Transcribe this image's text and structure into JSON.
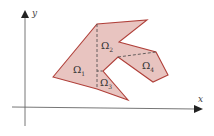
{
  "diagram": {
    "axes": {
      "x_label": "x",
      "y_label": "y",
      "color": "#555555"
    },
    "region": {
      "fill": "#e8c4c0",
      "stroke": "#b0403a",
      "outline": [
        [
          53,
          77
        ],
        [
          97,
          24
        ],
        [
          147,
          20
        ],
        [
          119,
          42
        ],
        [
          156,
          52
        ],
        [
          168,
          75
        ],
        [
          153,
          82
        ],
        [
          118,
          57
        ],
        [
          103,
          71
        ],
        [
          128,
          100
        ],
        [
          97,
          89
        ]
      ]
    },
    "subregions": [
      {
        "name": "Omega 1",
        "symbol": "Ω",
        "index": "1"
      },
      {
        "name": "Omega 2",
        "symbol": "Ω",
        "index": "2"
      },
      {
        "name": "Omega 3",
        "symbol": "Ω",
        "index": "3"
      },
      {
        "name": "Omega 4",
        "symbol": "Ω",
        "index": "4"
      }
    ],
    "dashed_divider_color": "#444444"
  }
}
